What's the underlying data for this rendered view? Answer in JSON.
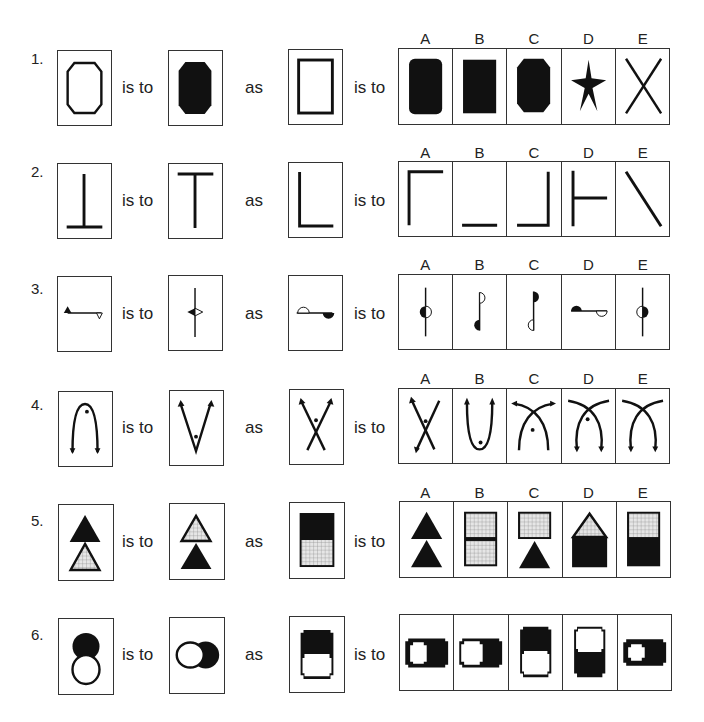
{
  "layout_words": {
    "is_to": "is to",
    "as": "as"
  },
  "option_letters": [
    "A",
    "B",
    "C",
    "D",
    "E"
  ],
  "questions": [
    {
      "number": "1.",
      "stem": [
        "outline-octagon",
        "filled-octagon",
        "outline-rectangle"
      ],
      "options": [
        {
          "letter": "A",
          "figure": "filled-rounded-rectangle"
        },
        {
          "letter": "B",
          "figure": "filled-rectangle"
        },
        {
          "letter": "C",
          "figure": "filled-octagon"
        },
        {
          "letter": "D",
          "figure": "filled-star"
        },
        {
          "letter": "E",
          "figure": "crossed-lines-x"
        }
      ]
    },
    {
      "number": "2.",
      "stem": [
        "inverted-t",
        "t-shape",
        "l-shape"
      ],
      "options": [
        {
          "letter": "A",
          "figure": "corner-top-left"
        },
        {
          "letter": "B",
          "figure": "horizontal-line-bottom"
        },
        {
          "letter": "C",
          "figure": "corner-bottom-right"
        },
        {
          "letter": "D",
          "figure": "t-rotated-right"
        },
        {
          "letter": "E",
          "figure": "diagonal-line"
        }
      ]
    },
    {
      "number": "3.",
      "stem": [
        "line-with-triangles",
        "vertical-line-with-arrowheads",
        "line-with-semicircles"
      ],
      "options": [
        {
          "letter": "A",
          "figure": "vertical-line-circle-left-filled"
        },
        {
          "letter": "B",
          "figure": "vertical-line-semicircles-b"
        },
        {
          "letter": "C",
          "figure": "vertical-line-semicircles-c"
        },
        {
          "letter": "D",
          "figure": "horizontal-line-semicircles"
        },
        {
          "letter": "E",
          "figure": "vertical-line-circle-right-filled"
        }
      ]
    },
    {
      "number": "4.",
      "stem": [
        "arch-with-arrows-dot",
        "v-with-arrows-dot",
        "crossed-arrows-dot"
      ],
      "options": [
        {
          "letter": "A",
          "figure": "crossed-arrows-dot-down"
        },
        {
          "letter": "B",
          "figure": "u-with-arrows-dot"
        },
        {
          "letter": "C",
          "figure": "crossed-curves-arrows-top-dot"
        },
        {
          "letter": "D",
          "figure": "crossed-curves-arrows-bottom-dot"
        },
        {
          "letter": "E",
          "figure": "crossed-curves-arrows-bottom"
        }
      ]
    },
    {
      "number": "5.",
      "stem": [
        "black-over-hatched-triangle",
        "hatched-over-black-triangle",
        "black-over-hatched-rectangle"
      ],
      "options": [
        {
          "letter": "A",
          "figure": "two-black-triangles"
        },
        {
          "letter": "B",
          "figure": "two-hatched-rectangles"
        },
        {
          "letter": "C",
          "figure": "hatched-rect-over-black-triangle"
        },
        {
          "letter": "D",
          "figure": "hatched-triangle-over-black-rect"
        },
        {
          "letter": "E",
          "figure": "hatched-over-black-rectangle"
        }
      ]
    },
    {
      "number": "6.",
      "stem": [
        "black-circle-over-white-circle",
        "white-circle-left-of-black",
        "black-block-over-white-block"
      ],
      "options": [
        {
          "letter": "A",
          "figure": "white-block-left-in-black"
        },
        {
          "letter": "B",
          "figure": "white-block-left-of-black"
        },
        {
          "letter": "C",
          "figure": "black-block-over-white"
        },
        {
          "letter": "D",
          "figure": "white-block-over-black"
        },
        {
          "letter": "E",
          "figure": "small-white-block-left-in-black"
        }
      ]
    }
  ]
}
